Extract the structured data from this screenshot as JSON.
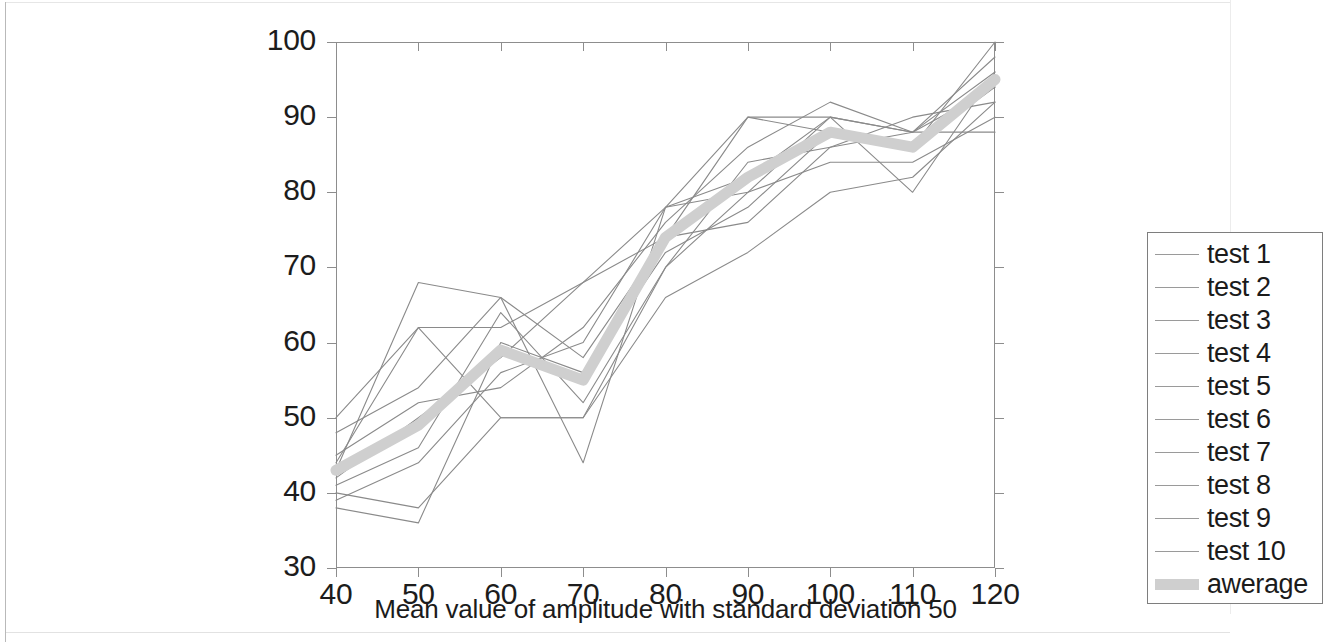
{
  "chart_data": {
    "type": "line",
    "title": "",
    "xlabel": "Mean value of amplitude with standard deviation 50",
    "ylabel": "Percentage of successfoul hit - detection of simul. obj.",
    "xlim": [
      40,
      120
    ],
    "ylim": [
      30,
      100
    ],
    "xticks": [
      40,
      50,
      60,
      70,
      80,
      90,
      100,
      110,
      120
    ],
    "yticks": [
      30,
      40,
      50,
      60,
      70,
      80,
      90,
      100
    ],
    "grid": false,
    "legend_position": "lower right",
    "x": [
      40,
      50,
      60,
      70,
      80,
      90,
      100,
      110,
      120
    ],
    "series": [
      {
        "name": "test 1",
        "values": [
          50,
          62,
          62,
          68,
          78,
          80,
          90,
          88,
          88
        ],
        "color": "#8a8a8a",
        "width": 1.1
      },
      {
        "name": "test 2",
        "values": [
          43,
          68,
          66,
          58,
          74,
          90,
          90,
          88,
          98
        ],
        "color": "#8a8a8a",
        "width": 1.1
      },
      {
        "name": "test 3",
        "values": [
          44,
          62,
          50,
          50,
          66,
          72,
          80,
          82,
          92
        ],
        "color": "#8a8a8a",
        "width": 1.1
      },
      {
        "name": "test 4",
        "values": [
          38,
          36,
          60,
          56,
          72,
          78,
          88,
          86,
          100
        ],
        "color": "#8a8a8a",
        "width": 1.1
      },
      {
        "name": "test 5",
        "values": [
          40,
          38,
          50,
          50,
          70,
          84,
          86,
          88,
          94
        ],
        "color": "#8a8a8a",
        "width": 1.1
      },
      {
        "name": "test 6",
        "values": [
          48,
          54,
          66,
          44,
          78,
          82,
          90,
          80,
          96
        ],
        "color": "#8a8a8a",
        "width": 1.1
      },
      {
        "name": "test 7",
        "values": [
          42,
          50,
          58,
          68,
          74,
          76,
          86,
          90,
          92
        ],
        "color": "#8a8a8a",
        "width": 1.1
      },
      {
        "name": "test 8",
        "values": [
          45,
          52,
          54,
          62,
          76,
          86,
          92,
          88,
          96
        ],
        "color": "#8a8a8a",
        "width": 1.1
      },
      {
        "name": "test 9",
        "values": [
          41,
          46,
          64,
          52,
          70,
          80,
          84,
          84,
          90
        ],
        "color": "#8a8a8a",
        "width": 1.1
      },
      {
        "name": "test 10",
        "values": [
          39,
          44,
          56,
          60,
          78,
          90,
          88,
          86,
          94
        ],
        "color": "#8a8a8a",
        "width": 1.1
      },
      {
        "name": "awerage",
        "values": [
          43,
          49,
          59,
          55,
          74,
          82,
          88,
          86,
          95
        ],
        "color": "#cfcfcf",
        "width": 11
      }
    ]
  },
  "legend": {
    "items": [
      {
        "label": "test 1",
        "style": "line"
      },
      {
        "label": "test 2",
        "style": "line"
      },
      {
        "label": "test 3",
        "style": "line"
      },
      {
        "label": "test 4",
        "style": "line"
      },
      {
        "label": "test 5",
        "style": "line"
      },
      {
        "label": "test 6",
        "style": "line"
      },
      {
        "label": "test 7",
        "style": "line"
      },
      {
        "label": "test 8",
        "style": "line"
      },
      {
        "label": "test 9",
        "style": "line"
      },
      {
        "label": "test 10",
        "style": "line"
      },
      {
        "label": "awerage",
        "style": "band"
      }
    ]
  },
  "colors": {
    "axis": "#8d8d8d",
    "text": "#1b1b1b",
    "series_line": "#8a8a8a",
    "average_band": "#cfcfcf",
    "background": "#ffffff"
  }
}
